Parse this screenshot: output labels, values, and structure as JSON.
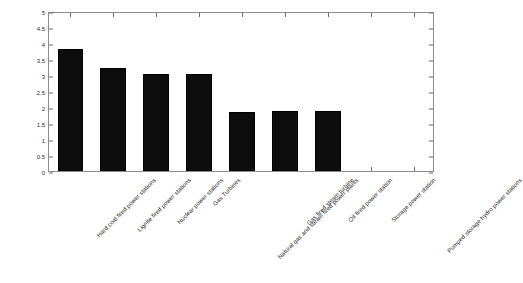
{
  "chart_data": {
    "type": "bar",
    "title": "",
    "xlabel": "",
    "ylabel": "Percent",
    "ylim": [
      0,
      5
    ],
    "ytick_labels": [
      "0",
      "0.5",
      "1",
      "1.5",
      "2",
      "2.5",
      "3",
      "3.5",
      "4",
      "4.5",
      "5"
    ],
    "ytick_values": [
      0,
      0.5,
      1,
      1.5,
      2,
      2.5,
      3,
      3.5,
      4,
      4.5,
      5
    ],
    "grid": false,
    "legend": null,
    "categories": [
      "Hard coal fired power stations",
      "Lignite fired power stations",
      "Nuclear power stations",
      "Gas Turbines",
      "Natural gas and steam fired power plants",
      "Gas fired steam turbine",
      "Oil fired power station",
      "Storage power station",
      "Pumped storage hydro power stations"
    ],
    "values": [
      3.82,
      3.22,
      3.03,
      3.04,
      1.85,
      1.86,
      1.86,
      0,
      0
    ],
    "bar_color": "#0d0d0d",
    "axis_color": "#8c8c8c",
    "background_color": "#ffffff"
  }
}
